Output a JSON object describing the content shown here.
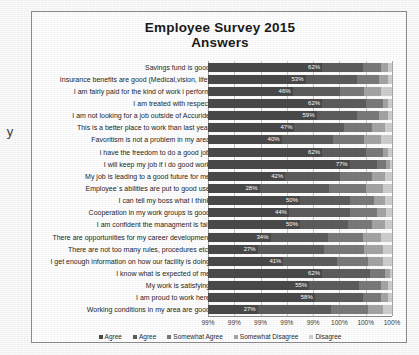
{
  "chart_data": {
    "type": "bar",
    "subtype": "stacked-horizontal-100",
    "title": "Employee Survey 2015",
    "subtitle": "Answers",
    "xlabel": "",
    "ylabel": "y",
    "grid": true,
    "legend_position": "bottom",
    "xlim": [
      99,
      100
    ],
    "xticks": [
      "99%",
      "99%",
      "99%",
      "99%",
      "99%",
      "100%",
      "100%",
      "100%"
    ],
    "categories": [
      "Savings fund is good",
      "Insurance benefits are good (Medical,vision, life)",
      "I am fairly paid for the kind of work i perform",
      "I am treated with respect",
      "I am not looking for a job outside of Accuride",
      "This is a better place to work than last year",
      "Favoritism is not a problem in my area",
      "i have the freedom to do a good job",
      "I will keep my job if i do good work",
      "My job is leading to a good future for me",
      "Employee´s abilities are put to good use",
      "I can tell my boss what I think",
      "Cooperation in my work groups is good",
      "I am confident the managment is fair",
      "There are opportunities for my career development",
      "There are not too many rules, procedures etc.",
      "I get enough information on how our facility is doing",
      "I know what is expected of me",
      "My work is satisfying",
      "I am proud to work here",
      "Working conditions in my area are good"
    ],
    "series": [
      {
        "name": "Agree",
        "color": "#4a4a4a",
        "values": [
          62,
          53,
          46,
          62,
          59,
          47,
          40,
          62,
          77,
          42,
          28,
          50,
          44,
          50,
          34,
          27,
          41,
          62,
          55,
          58,
          27
        ]
      },
      {
        "name": "Agree",
        "color": "#5d5d5d",
        "values": [
          22,
          28,
          26,
          24,
          22,
          27,
          28,
          24,
          15,
          30,
          38,
          27,
          33,
          26,
          31,
          36,
          29,
          26,
          27,
          26,
          40
        ]
      },
      {
        "name": "Somewhat Agree",
        "color": "#7a7a7a",
        "values": [
          10,
          12,
          13,
          9,
          12,
          15,
          17,
          9,
          5,
          17,
          20,
          13,
          15,
          13,
          19,
          22,
          17,
          8,
          12,
          10,
          20
        ]
      },
      {
        "name": "Somewhat Disagree",
        "color": "#a5a5a5",
        "values": [
          4,
          5,
          9,
          3,
          5,
          7,
          9,
          3,
          2,
          7,
          9,
          6,
          5,
          7,
          10,
          10,
          8,
          3,
          4,
          4,
          8
        ]
      },
      {
        "name": "Disagree",
        "color": "#cfcfcf",
        "values": [
          2,
          2,
          6,
          2,
          2,
          4,
          6,
          2,
          1,
          4,
          5,
          4,
          3,
          4,
          6,
          5,
          5,
          1,
          2,
          2,
          5
        ]
      }
    ],
    "data_labels": [
      "62%",
      "53%",
      "46%",
      "62%",
      "59%",
      "47%",
      "40%",
      "62%",
      "77%",
      "42%",
      "28%",
      "50%",
      "44%",
      "50%",
      "34%",
      "27%",
      "41%",
      "62%",
      "55%",
      "58%",
      "27%"
    ]
  }
}
